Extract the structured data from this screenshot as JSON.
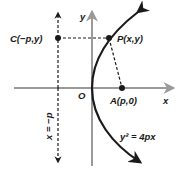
{
  "diagram": {
    "axes": {
      "x_label": "x",
      "y_label": "y",
      "origin_label": "O"
    },
    "points": {
      "C": {
        "label": "C(−p,y)"
      },
      "P": {
        "label": "P(x,y)"
      },
      "A": {
        "label": "A(p,0)"
      }
    },
    "directrix": {
      "label": "x = −p"
    },
    "curve": {
      "equation": "y² = 4px"
    },
    "colors": {
      "axis": "#9a9a9a",
      "curve": "#1a1a1a",
      "dashed": "#1a1a1a",
      "point": "#1a1a1a"
    }
  }
}
